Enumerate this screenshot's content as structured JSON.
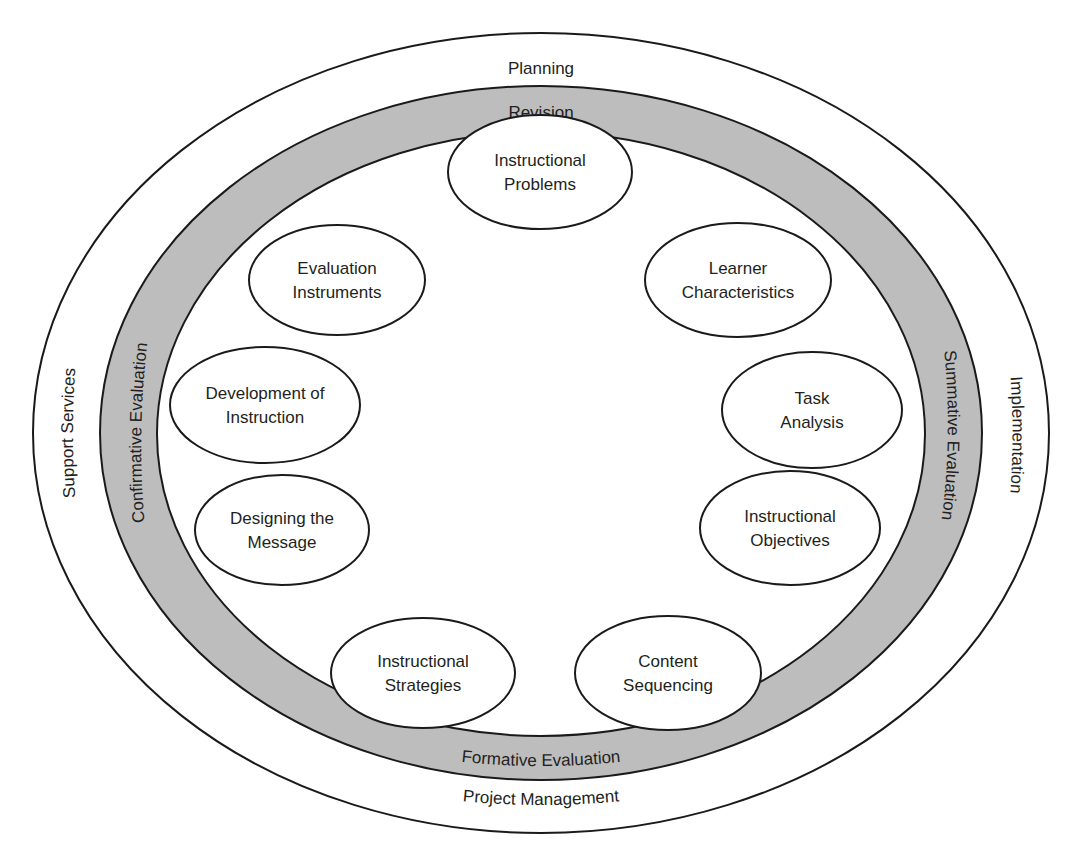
{
  "diagram": {
    "type": "concentric-ellipse model",
    "colors": {
      "background": "#ffffff",
      "stroke": "#1a1a1a",
      "band_fill": "#bdbdbd",
      "text": "#231f20"
    },
    "outer_ring": {
      "top_label": "Planning",
      "bottom_label": "Project Management",
      "left_label": "Support Services",
      "right_label": "Implementation"
    },
    "evaluation_band": {
      "top_label": "Revision",
      "bottom_label": "Formative Evaluation",
      "left_label": "Confirmative Evaluation",
      "right_label": "Summative Evaluation"
    },
    "nodes": [
      {
        "line1": "Instructional",
        "line2": "Problems"
      },
      {
        "line1": "Learner",
        "line2": "Characteristics"
      },
      {
        "line1": "Task",
        "line2": "Analysis"
      },
      {
        "line1": "Instructional",
        "line2": "Objectives"
      },
      {
        "line1": "Content",
        "line2": "Sequencing"
      },
      {
        "line1": "Instructional",
        "line2": "Strategies"
      },
      {
        "line1": "Designing the",
        "line2": "Message"
      },
      {
        "line1": "Development of",
        "line2": "Instruction"
      },
      {
        "line1": "Evaluation",
        "line2": "Instruments"
      }
    ]
  }
}
